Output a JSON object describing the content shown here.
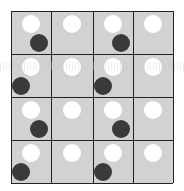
{
  "grid": {
    "rows": 4,
    "cols": 4,
    "x_lines": [
      11,
      51,
      93,
      133,
      173
    ],
    "y_lines": [
      11,
      54,
      97,
      140,
      183
    ],
    "cell_color": "#d2d2d2",
    "line_color": "#222222",
    "white_dot_color": "#ffffff",
    "dark_dot_color": "#3a3a3a"
  },
  "cells": [
    {
      "row": 0,
      "col": 0,
      "dark": "bottom-right"
    },
    {
      "row": 0,
      "col": 1,
      "dark": null
    },
    {
      "row": 0,
      "col": 2,
      "dark": "bottom-right"
    },
    {
      "row": 0,
      "col": 3,
      "dark": null
    },
    {
      "row": 1,
      "col": 0,
      "dark": "bottom-left"
    },
    {
      "row": 1,
      "col": 1,
      "dark": null
    },
    {
      "row": 1,
      "col": 2,
      "dark": "bottom-left"
    },
    {
      "row": 1,
      "col": 3,
      "dark": null
    },
    {
      "row": 2,
      "col": 0,
      "dark": "bottom-right"
    },
    {
      "row": 2,
      "col": 1,
      "dark": null
    },
    {
      "row": 2,
      "col": 2,
      "dark": "bottom-right"
    },
    {
      "row": 2,
      "col": 3,
      "dark": null
    },
    {
      "row": 3,
      "col": 0,
      "dark": "bottom-left"
    },
    {
      "row": 3,
      "col": 1,
      "dark": null
    },
    {
      "row": 3,
      "col": 2,
      "dark": "bottom-left"
    },
    {
      "row": 3,
      "col": 3,
      "dark": null
    }
  ]
}
